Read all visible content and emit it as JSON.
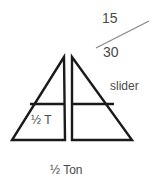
{
  "figure": {
    "title": "",
    "background_color": "#ffffff",
    "stroke_color": "#1a1a1a",
    "text_color": "#4a4a4a",
    "labels": {
      "upper_number": "15",
      "lower_number": "30",
      "slider": "slider",
      "inner_triangle": "½ T",
      "caption": "½ Ton"
    },
    "shapes": {
      "left_triangle": {
        "name": "left-right-triangle",
        "apex": [
          64,
          57
        ],
        "base_left": [
          12,
          140
        ],
        "base_right": [
          65,
          140
        ],
        "divider_y": 104
      },
      "right_triangle": {
        "name": "right-right-triangle",
        "apex": [
          72,
          57
        ],
        "base_left": [
          72,
          140
        ],
        "base_right": [
          132,
          140
        ],
        "divider_y": 104
      },
      "slider_line": {
        "name": "slider-diagonal-line",
        "from": [
          96,
          48
        ],
        "to": [
          149,
          21
        ]
      }
    }
  }
}
